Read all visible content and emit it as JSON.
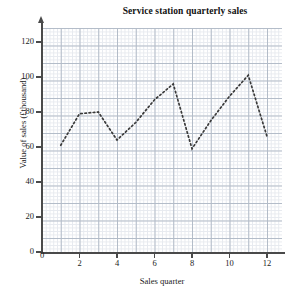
{
  "chart_data": {
    "type": "line",
    "title": "Service station quarterly sales",
    "xlabel": "Sales quarter",
    "ylabel": "Value of sales (£thousand)",
    "xlim": [
      0,
      12.8
    ],
    "ylim": [
      0,
      128
    ],
    "xticks": [
      0,
      2,
      4,
      6,
      8,
      10,
      12
    ],
    "yticks": [
      0,
      20,
      40,
      60,
      80,
      100,
      120
    ],
    "grid": "major and minor grid shown",
    "legend": "none",
    "line_style": "dotted",
    "line_color": "#3a3a3a",
    "x": [
      1,
      2,
      3,
      4,
      5,
      6,
      7,
      8,
      9,
      10,
      11,
      12
    ],
    "values": [
      61,
      79,
      80,
      64,
      74,
      87,
      96,
      59,
      75,
      89,
      101,
      66
    ],
    "series": [
      {
        "name": "Quarterly sales",
        "values": [
          61,
          79,
          80,
          64,
          74,
          87,
          96,
          59,
          75,
          89,
          101,
          66
        ]
      }
    ]
  },
  "axis": {
    "y_tick_labels": [
      "0",
      "20",
      "40",
      "60",
      "80",
      "100",
      "120"
    ],
    "x_tick_labels": [
      "0",
      "2",
      "4",
      "6",
      "8",
      "10",
      "12"
    ],
    "y_title": "Value of sales (£thousand)",
    "x_title": "Sales quarter"
  },
  "header": {
    "title": "Service station quarterly sales"
  },
  "colors": {
    "line": "#3a3a3a",
    "grid_major": "#aab4c2",
    "grid_minor": "#dfe3ea",
    "axis": "#4a4a4a",
    "background": "#ffffff"
  }
}
